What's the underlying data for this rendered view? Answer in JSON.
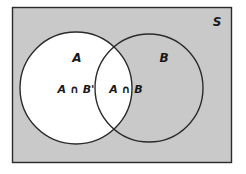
{
  "figure": {
    "type": "venn-diagram",
    "universe": {
      "label": "S",
      "fill_color": "#c9c9c9",
      "border_color": "#2b2b2b"
    },
    "sets": [
      {
        "id": "A",
        "label": "A",
        "fill_color": "#ffffff",
        "border_color": "#2b2b2b"
      },
      {
        "id": "B",
        "label": "B",
        "fill_color": "#c9c9c9",
        "border_color": "#2b2b2b"
      }
    ],
    "regions": [
      {
        "id": "a-only",
        "label": "A ∩ B'",
        "fill_color": "#ffffff"
      },
      {
        "id": "a-and-b",
        "label": "A ∩ B",
        "fill_color": "#ffffff"
      }
    ]
  }
}
